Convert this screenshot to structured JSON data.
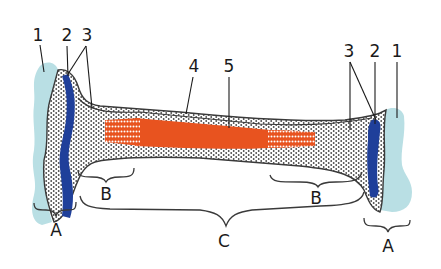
{
  "diagram": {
    "colors": {
      "cartilage": "#b9dfe4",
      "growth_plate": "#1f3f9a",
      "spongy_bone_dots": "#4a4a4a",
      "marrow_cavity": "#e8531f",
      "outline": "#3a3a3a",
      "background": "#ffffff"
    },
    "number_labels": [
      {
        "id": "1",
        "text": "1",
        "side": "left"
      },
      {
        "id": "2",
        "text": "2",
        "side": "left"
      },
      {
        "id": "3",
        "text": "3",
        "side": "left"
      },
      {
        "id": "4",
        "text": "4",
        "side": "center"
      },
      {
        "id": "5",
        "text": "5",
        "side": "center"
      },
      {
        "id": "3r",
        "text": "3",
        "side": "right"
      },
      {
        "id": "2r",
        "text": "2",
        "side": "right"
      },
      {
        "id": "1r",
        "text": "1",
        "side": "right"
      }
    ],
    "region_labels": [
      {
        "id": "A-left",
        "text": "A"
      },
      {
        "id": "B-left",
        "text": "B"
      },
      {
        "id": "C",
        "text": "C"
      },
      {
        "id": "B-right",
        "text": "B"
      },
      {
        "id": "A-right",
        "text": "A"
      }
    ]
  }
}
